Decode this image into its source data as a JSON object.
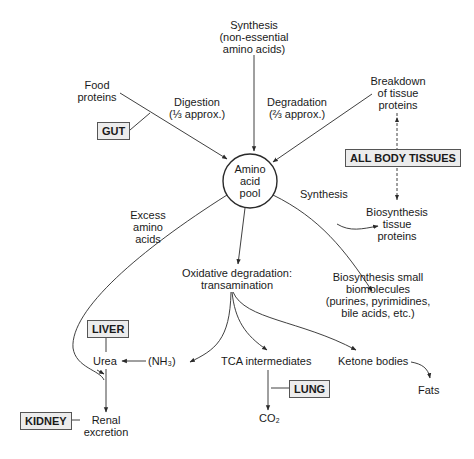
{
  "center": {
    "label_lines": [
      "Amino",
      "acid",
      "pool"
    ]
  },
  "nodes": {
    "synthesis_nonessential": [
      "Synthesis",
      "(non-essential",
      "amino acids)"
    ],
    "food_proteins": [
      "Food",
      "proteins"
    ],
    "digestion": [
      "Digestion",
      "(⅓ approx.)"
    ],
    "breakdown_tissue": [
      "Breakdown",
      "of tissue",
      "proteins"
    ],
    "degradation": [
      "Degradation",
      "(⅔ approx.)"
    ],
    "synthesis_label": "Synthesis",
    "biosynthesis_tissue": [
      "Biosynthesis",
      "tissue",
      "proteins"
    ],
    "excess_amino": [
      "Excess",
      "amino",
      "acids"
    ],
    "oxidative": [
      "Oxidative degradation:",
      "transamination"
    ],
    "biosynthesis_small": [
      "Biosynthesis small",
      "biomolecules",
      "(purines, pyrimidines,",
      "bile acids, etc.)"
    ],
    "urea": "Urea",
    "nh3": "(NH₃)",
    "tca": "TCA intermediates",
    "ketone": "Ketone bodies",
    "fats": "Fats",
    "co2": "CO₂",
    "renal": [
      "Renal",
      "excretion"
    ]
  },
  "organs": {
    "gut": "GUT",
    "all_body_tissues": "ALL BODY TISSUES",
    "liver": "LIVER",
    "kidney": "KIDNEY",
    "lung": "LUNG"
  },
  "colors": {
    "line": "#2a2a2a",
    "box_bg": "#ececec",
    "box_border": "#555555"
  }
}
